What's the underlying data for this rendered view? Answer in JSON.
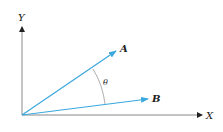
{
  "diagram": {
    "type": "vector-angle",
    "axes": {
      "x_label": "X",
      "y_label": "Y",
      "axis_color": "#555555"
    },
    "vectors": [
      {
        "name": "A",
        "label": "A",
        "color": "#3aa8dc"
      },
      {
        "name": "B",
        "label": "B",
        "color": "#3aa8dc"
      }
    ],
    "angle": {
      "label": "θ",
      "between": [
        "A",
        "B"
      ],
      "arc_color": "#999999"
    }
  }
}
